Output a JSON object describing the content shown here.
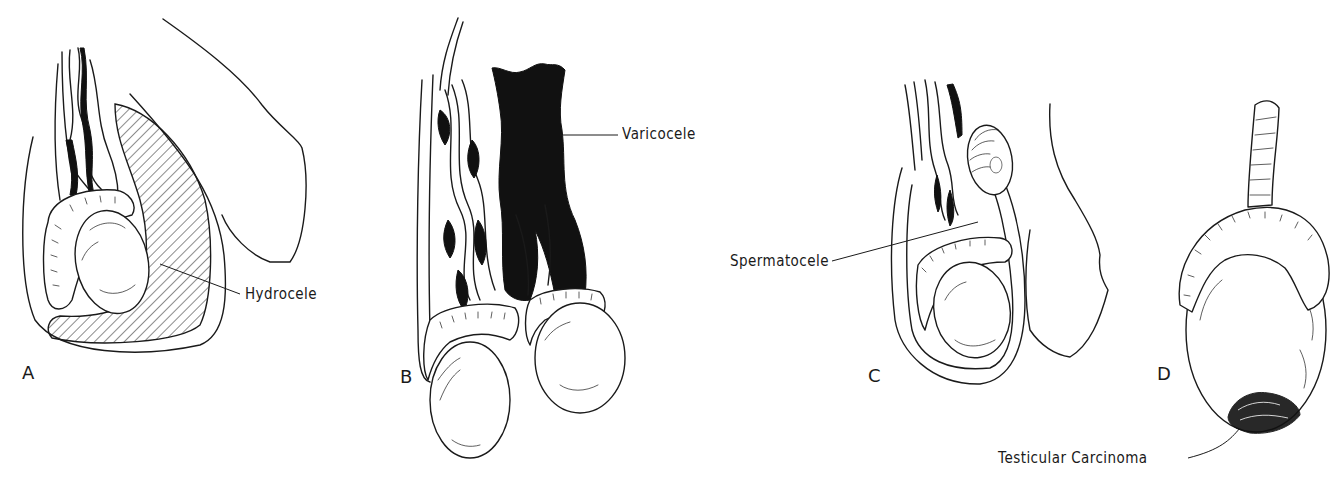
{
  "figure": {
    "panels": [
      {
        "letter": "A",
        "label": "Hydrocele"
      },
      {
        "letter": "B",
        "label": "Varicocele"
      },
      {
        "letter": "C",
        "label": "Spermatocele"
      },
      {
        "letter": "D",
        "label": "Testicular Carcinoma"
      }
    ]
  }
}
